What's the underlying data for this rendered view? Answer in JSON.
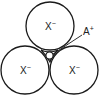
{
  "diagram": {
    "type": "ionic-packing",
    "stroke_color": "#1a1a1a",
    "background": "#ffffff",
    "anions": [
      {
        "id": "top",
        "label": "X",
        "charge": "−",
        "cx": 50,
        "cy": 26,
        "r": 24
      },
      {
        "id": "bottom-left",
        "label": "X",
        "charge": "−",
        "cx": 25,
        "cy": 70,
        "r": 24
      },
      {
        "id": "bottom-right",
        "label": "X",
        "charge": "−",
        "cx": 74,
        "cy": 70,
        "r": 24
      }
    ],
    "cation": {
      "label": "A",
      "charge": "+",
      "cx": 49.5,
      "cy": 55.5,
      "r": 4
    },
    "leader_line": {
      "x1": 53,
      "y1": 54,
      "x2": 82,
      "y2": 35
    },
    "cation_label_pos": {
      "x": 83,
      "y": 34
    }
  }
}
